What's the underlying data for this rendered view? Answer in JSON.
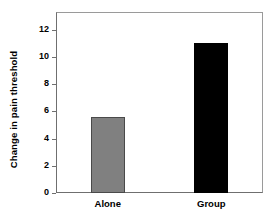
{
  "chart_data": {
    "type": "bar",
    "title": "",
    "subtitle": "",
    "xlabel": "",
    "ylabel": "Change in pain threshold",
    "categories": [
      "Alone",
      "Group"
    ],
    "values": [
      5.6,
      11.0
    ],
    "series": [
      {
        "name": "Change in pain threshold",
        "values": [
          5.6,
          11.0
        ]
      }
    ],
    "bar_colors": [
      "#808080",
      "#000000"
    ],
    "bar_edge_colors": [
      "#4a4a4a",
      "#000000"
    ],
    "ylim": [
      0,
      13.3
    ],
    "yticks": [
      0,
      2,
      4,
      6,
      8,
      10,
      12
    ],
    "ytick_labels": [
      "0",
      "2",
      "4",
      "6",
      "8",
      "10",
      "12"
    ],
    "grid": false,
    "legend": false,
    "legend_position": "none",
    "annotations": []
  },
  "axes": {
    "y_title": "Change in pain threshold",
    "frame_color": "#6f6f6f",
    "tick_color": "#6f6f6f",
    "text_color": "#000000"
  },
  "figure": {
    "background": "#ffffff"
  }
}
